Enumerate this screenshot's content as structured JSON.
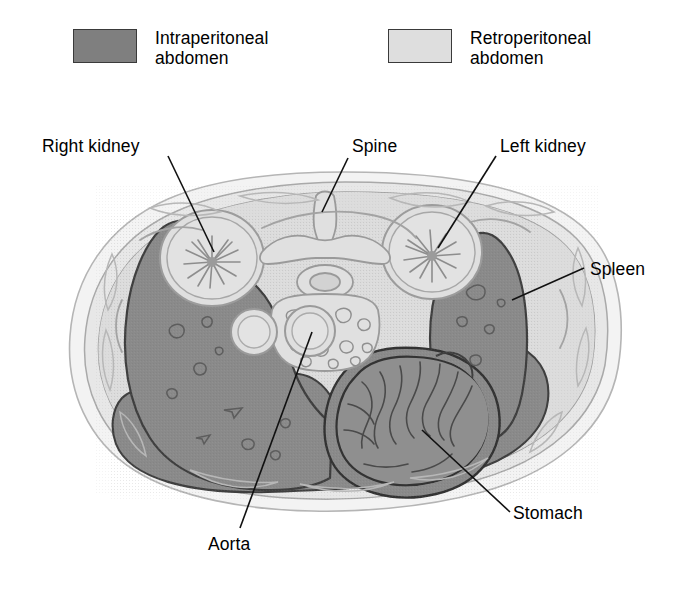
{
  "legend": {
    "entries": [
      {
        "key": "intraperitoneal",
        "label": "Intraperitoneal\nabdomen",
        "swatch_name": "intraperitoneal-swatch",
        "color": "#7f7f7f"
      },
      {
        "key": "retroperitoneal",
        "label": "Retroperitoneal\nabdomen",
        "swatch_name": "retroperitoneal-swatch",
        "color": "#dedede"
      }
    ]
  },
  "labels": {
    "right_kidney": "Right kidney",
    "spine": "Spine",
    "left_kidney": "Left kidney",
    "spleen": "Spleen",
    "stomach": "Stomach",
    "aorta": "Aorta"
  },
  "colors": {
    "intraperitoneal_fill": "#8a8a8a",
    "retroperitoneal_fill": "#dcdcdc",
    "body_wall_fill": "#e4e4e4",
    "skin_outline_fill": "#efefef",
    "organ_outline": "#4a4a4a",
    "faint_outline": "#a9a9a9",
    "leader_line": "#111111",
    "text": "#000000",
    "background": "#ffffff"
  },
  "structures": [
    {
      "name": "body-wall",
      "region": "body wall / subcutaneous fat and muscle"
    },
    {
      "name": "liver",
      "region": "intraperitoneal",
      "side": "right"
    },
    {
      "name": "spleen",
      "region": "intraperitoneal",
      "side": "left"
    },
    {
      "name": "stomach",
      "region": "intraperitoneal",
      "side": "left"
    },
    {
      "name": "bowel-mesentery",
      "region": "intraperitoneal",
      "side": "central-inferior"
    },
    {
      "name": "right-kidney",
      "region": "retroperitoneal",
      "side": "right"
    },
    {
      "name": "left-kidney",
      "region": "retroperitoneal",
      "side": "left"
    },
    {
      "name": "vertebral-body",
      "region": "retroperitoneal",
      "side": "midline"
    },
    {
      "name": "spinal-canal",
      "region": "retroperitoneal",
      "side": "midline"
    },
    {
      "name": "spinous-process",
      "region": "retroperitoneal",
      "side": "midline-posterior"
    },
    {
      "name": "aorta",
      "region": "retroperitoneal",
      "side": "midline-left"
    },
    {
      "name": "inferior-vena-cava",
      "region": "retroperitoneal",
      "side": "midline-right"
    },
    {
      "name": "pancreas",
      "region": "retroperitoneal",
      "side": "central"
    }
  ]
}
